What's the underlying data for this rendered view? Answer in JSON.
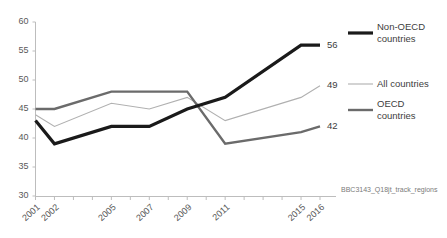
{
  "caption": "BBC3143_Q18jt_track_regions",
  "legend": {
    "position": "right",
    "items": [
      {
        "label_line1": "Non-OECD",
        "label_line2": "countries",
        "color": "#1a1a1a",
        "width": 3.2
      },
      {
        "label_line1": "All countries",
        "label_line2": "",
        "color": "#b0b0b0",
        "width": 1.1
      },
      {
        "label_line1": "OECD",
        "label_line2": "countries",
        "color": "#6b6b6b",
        "width": 2.4
      }
    ]
  },
  "end_labels": [
    {
      "text": "56",
      "series": "Non-OECD countries"
    },
    {
      "text": "49",
      "series": "All countries"
    },
    {
      "text": "42",
      "series": "OECD countries"
    }
  ],
  "chart_data": {
    "type": "line",
    "title": "",
    "subtitle": "",
    "xlabel": "",
    "ylabel": "",
    "ylim": [
      30,
      60
    ],
    "yticks": [
      30,
      35,
      40,
      45,
      50,
      55,
      60
    ],
    "grid": false,
    "legend_position": "right",
    "categories": [
      "2001",
      "2002",
      "2005",
      "2007",
      "2009",
      "2011",
      "2015",
      "2016"
    ],
    "x_tick_labels": [
      "2001",
      "2002",
      "",
      "",
      "2005",
      "",
      "2007",
      "",
      "2009",
      "",
      "2011",
      "",
      "",
      "",
      "2015",
      "2016"
    ],
    "x": [
      2001,
      2002,
      2005,
      2007,
      2009,
      2011,
      2015,
      2016
    ],
    "series": [
      {
        "name": "Non-OECD countries",
        "color": "#1a1a1a",
        "width": 3.2,
        "values": [
          43,
          39,
          42,
          42,
          45,
          47,
          56,
          56
        ],
        "end_label": "56"
      },
      {
        "name": "All countries",
        "color": "#b0b0b0",
        "width": 1.1,
        "values": [
          44,
          42,
          46,
          45,
          47,
          43,
          47,
          49
        ],
        "end_label": "49"
      },
      {
        "name": "OECD countries",
        "color": "#6b6b6b",
        "width": 2.4,
        "values": [
          45,
          45,
          48,
          48,
          48,
          39,
          41,
          42
        ],
        "end_label": "42"
      }
    ],
    "annotations": [
      "BBC3143_Q18jt_track_regions"
    ]
  }
}
